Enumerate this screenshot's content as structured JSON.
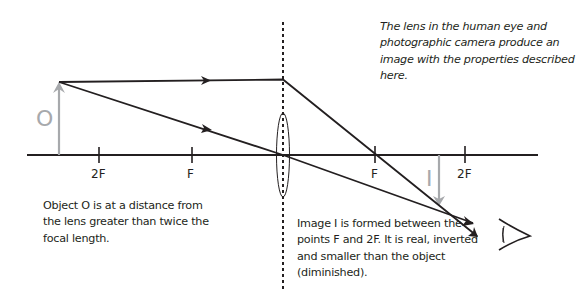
{
  "caption_top": "The lens in the human eye and photographic camera produce an image with the properties described here.",
  "caption_object": "Object O is at a distance from the lens greater than twice the focal length.",
  "caption_image": "Image I is formed between the points F and 2F. It is real, inverted and smaller than the object (diminished).",
  "labels": {
    "object": "O",
    "image": "I",
    "two_f_left": "2F",
    "f_left": "F",
    "f_right": "F",
    "two_f_right": "2F"
  },
  "colors": {
    "ray": "#231f20",
    "object_arrow": "#a7a9ac",
    "image_arrow": "#a7a9ac"
  }
}
